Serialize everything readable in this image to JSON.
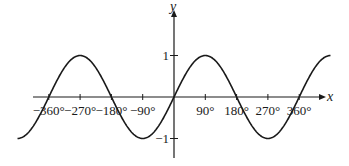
{
  "chart_data": {
    "type": "line",
    "title": "",
    "function": "y = sin x",
    "xlabel": "x",
    "ylabel": "y",
    "x_unit": "degrees",
    "xlim": [
      -450,
      450
    ],
    "ylim": [
      -1.3,
      1.6
    ],
    "grid": false,
    "legend": null,
    "x_ticks": [
      -360,
      -270,
      -180,
      -90,
      90,
      180,
      270,
      360
    ],
    "x_tick_labels": [
      "−360°",
      "−270°",
      "−180°",
      "−90°",
      "90°",
      "180°",
      "270°",
      "360°"
    ],
    "y_ticks": [
      1,
      -1
    ],
    "y_tick_labels": [
      "1",
      "−1"
    ],
    "series": [
      {
        "name": "sin x",
        "x": [
          -450,
          -360,
          -270,
          -180,
          -90,
          0,
          90,
          180,
          270,
          360,
          450
        ],
        "values": [
          -1,
          0,
          1,
          0,
          -1,
          0,
          1,
          0,
          -1,
          0,
          1
        ]
      }
    ],
    "line_color": "#1a1a1a"
  },
  "layout": {
    "origin_px": [
      174,
      97
    ],
    "px_per_90deg": 31.3,
    "px_per_unit_y": 41.5,
    "x_axis_px": [
      33,
      322
    ],
    "y_axis_px": [
      14,
      158
    ]
  }
}
